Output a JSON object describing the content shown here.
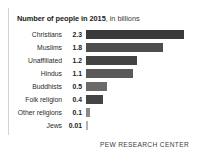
{
  "title": {
    "bold_part": "Number of people in 2015",
    "regular_part": ", in billions"
  },
  "source": "PEW RESEARCH CENTER",
  "colors": {
    "bar": "#4a4a4a",
    "bar_dark": "#3a3a3a",
    "frame_rule": "#d2d2d2",
    "background": "#ffffff",
    "text": "#231f20"
  },
  "chart_data": {
    "type": "bar",
    "orientation": "horizontal",
    "title": "Number of people in 2015, in billions",
    "xlabel": "",
    "ylabel": "",
    "xlim": [
      0,
      2.3
    ],
    "grid": false,
    "legend": "none",
    "categories": [
      "Christians",
      "Muslims",
      "Unaffiliated",
      "Hindus",
      "Buddhists",
      "Folk religion",
      "Other religions",
      "Jews"
    ],
    "values": [
      2.3,
      1.8,
      1.2,
      1.1,
      0.5,
      0.4,
      0.1,
      0.01
    ],
    "value_labels": [
      "2.3",
      "1.8",
      "1.2",
      "1.1",
      "0.5",
      "0.4",
      "0.1",
      "0.01"
    ],
    "rows": [
      {
        "label": "Christians",
        "value_label": "2.3",
        "value": 2.3,
        "shade": "#3a3a3a"
      },
      {
        "label": "Muslims",
        "value_label": "1.8",
        "value": 1.8,
        "shade": "#4e4e4e"
      },
      {
        "label": "Unaffiliated",
        "value_label": "1.2",
        "value": 1.2,
        "shade": "#434343"
      },
      {
        "label": "Hindus",
        "value_label": "1.1",
        "value": 1.1,
        "shade": "#5a5a5a"
      },
      {
        "label": "Buddhists",
        "value_label": "0.5",
        "value": 0.5,
        "shade": "#6a6a6a"
      },
      {
        "label": "Folk religion",
        "value_label": "0.4",
        "value": 0.4,
        "shade": "#444444"
      },
      {
        "label": "Other religions",
        "value_label": "0.1",
        "value": 0.1,
        "shade": "#8a8a8a"
      },
      {
        "label": "Jews",
        "value_label": "0.01",
        "value": 0.01,
        "shade": "#b4b4b4"
      }
    ]
  }
}
